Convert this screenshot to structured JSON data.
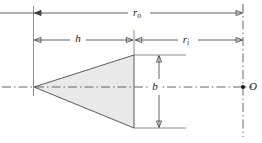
{
  "figure": {
    "type": "engineering-dimension-diagram",
    "background_color": "#ffffff",
    "line_color": "#3a3a3a",
    "fill_color": "#e9e9e9",
    "labels": {
      "outer_radius": {
        "symbol": "r",
        "subscript": "o",
        "full": "r_o"
      },
      "height": {
        "symbol": "h",
        "subscript": "",
        "full": "h"
      },
      "inner_radius": {
        "symbol": "r",
        "subscript": "i",
        "full": "r_i"
      },
      "base_diameter": {
        "symbol": "b",
        "subscript": "",
        "full": "b"
      },
      "origin_point": {
        "symbol": "O",
        "subscript": "",
        "full": "O"
      }
    },
    "geometry": {
      "apex_x": 34,
      "apex_y": 87,
      "base_x": 134,
      "base_top_y": 55,
      "base_bottom_y": 128,
      "axis_x": 243,
      "centerline_y": 87,
      "ro_line_y": 13,
      "h_line_y": 40,
      "ri_line_y": 40,
      "b_line_x": 159
    }
  }
}
